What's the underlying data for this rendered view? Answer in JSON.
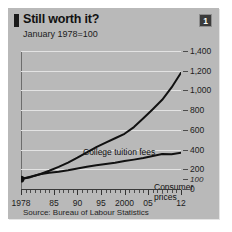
{
  "figure": {
    "title": "Still worth it?",
    "subtitle": "January 1978=100",
    "badge": "1",
    "source": "Source: Bureau of Labour Statistics",
    "panel_color": "#b9b9b9",
    "grid_color": "#e3e3e3",
    "line_color": "#111111"
  },
  "chart_data": {
    "type": "line",
    "title": "Still worth it?",
    "subtitle": "January 1978=100",
    "xlabel": "",
    "ylabel": "",
    "xlim": [
      1978,
      2012
    ],
    "ylim": [
      0,
      1400
    ],
    "yticks": [
      0,
      200,
      400,
      600,
      800,
      1000,
      1200,
      1400
    ],
    "ytick_labels": [
      "0",
      "200",
      "400",
      "600",
      "800",
      "1,000",
      "1,200",
      "1,400"
    ],
    "baseline_value": 100,
    "baseline_label": "100",
    "xticks": [
      1978,
      1985,
      1990,
      1995,
      2000,
      2005,
      2012
    ],
    "xtick_labels": [
      "1978",
      "85",
      "90",
      "95",
      "2000",
      "05",
      "12"
    ],
    "grid": true,
    "legend": "inline-annotations",
    "annotations": [
      {
        "text": "College tuition fees",
        "series": "College tuition fees"
      },
      {
        "text": "Consumer prices",
        "series": "Consumer prices"
      }
    ],
    "origin_marker": {
      "x": 1978,
      "y": 100,
      "shape": "circle",
      "color": "#111111"
    },
    "x": [
      1978,
      1980,
      1982,
      1984,
      1986,
      1988,
      1990,
      1992,
      1994,
      1996,
      1998,
      2000,
      2002,
      2004,
      2006,
      2008,
      2010,
      2012
    ],
    "series": [
      {
        "name": "College tuition fees",
        "values": [
          100,
          120,
          150,
          185,
          225,
          268,
          318,
          372,
          424,
          470,
          515,
          560,
          628,
          718,
          810,
          905,
          1030,
          1180
        ]
      },
      {
        "name": "Consumer prices",
        "values": [
          100,
          125,
          150,
          166,
          176,
          190,
          208,
          226,
          240,
          253,
          266,
          283,
          298,
          314,
          335,
          355,
          352,
          368
        ]
      }
    ]
  },
  "xlabels": [
    {
      "text": "1978",
      "year": 1978
    },
    {
      "text": "85",
      "year": 1985
    },
    {
      "text": "90",
      "year": 1990
    },
    {
      "text": "95",
      "year": 1995
    },
    {
      "text": "2000",
      "year": 2000
    },
    {
      "text": "05",
      "year": 2005
    },
    {
      "text": "12",
      "year": 2012
    }
  ],
  "ylabels": [
    {
      "text": "1,400",
      "value": 1400
    },
    {
      "text": "1,200",
      "value": 1200
    },
    {
      "text": "1,000",
      "value": 1000
    },
    {
      "text": "800",
      "value": 800
    },
    {
      "text": "600",
      "value": 600
    },
    {
      "text": "400",
      "value": 400
    },
    {
      "text": "200",
      "value": 200
    },
    {
      "text": "100",
      "value": 100
    },
    {
      "text": "0",
      "value": 0
    }
  ],
  "labels": {
    "tuition": "College tuition fees",
    "cpi_line1": "Consumer",
    "cpi_line2": "prices"
  }
}
